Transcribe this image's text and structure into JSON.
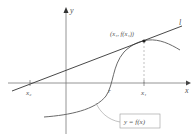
{
  "diagram": {
    "axes": {
      "x_label": "x",
      "y_label": "y"
    },
    "point_label": "(x₁, f(x₁))",
    "line_label": "l",
    "x_marks": [
      {
        "id": "x2",
        "label": "x₂"
      },
      {
        "id": "r",
        "label": "r"
      },
      {
        "id": "x1",
        "label": "x₁"
      }
    ],
    "curve_label": "y = f(x)",
    "colors": {
      "curve": "#6a6a6a",
      "line": "#333333",
      "axes": "#7a7a7a",
      "label_box": "#9a9a9a"
    }
  }
}
